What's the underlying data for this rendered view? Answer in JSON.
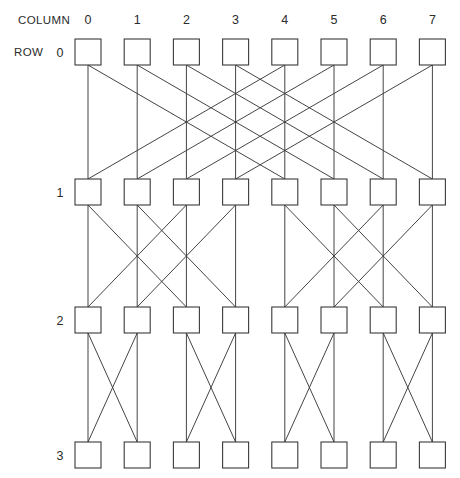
{
  "diagram": {
    "kind": "butterfly-network",
    "column_axis_label": "COLUMN",
    "row_axis_label": "ROW",
    "column_labels": [
      "0",
      "1",
      "2",
      "3",
      "4",
      "5",
      "6",
      "7"
    ],
    "row_labels": [
      "0",
      "1",
      "2",
      "3"
    ],
    "num_columns": 8,
    "num_rows": 4,
    "line_color": "#3a3a3a",
    "node_fill": "#ffffff",
    "node_stroke": "#3a3a3a",
    "background": "#ffffff",
    "geometry": {
      "first_col_center_x": 88,
      "col_spacing": 49.2,
      "box_width": 26,
      "box_height": 26,
      "row_center_y": [
        52,
        192,
        320,
        455
      ],
      "column_label_y": 20,
      "column_axis_label_x": 18,
      "row_axis_label_x": 14,
      "row_label_x": 60
    },
    "stages": [
      {
        "name": "stage-0",
        "from_row": 0,
        "to_row": 1,
        "stride": 4,
        "pairs": [
          [
            0,
            4
          ],
          [
            1,
            5
          ],
          [
            2,
            6
          ],
          [
            3,
            7
          ]
        ]
      },
      {
        "name": "stage-1",
        "from_row": 1,
        "to_row": 2,
        "stride": 2,
        "pairs": [
          [
            0,
            2
          ],
          [
            1,
            3
          ],
          [
            4,
            6
          ],
          [
            5,
            7
          ]
        ]
      },
      {
        "name": "stage-2",
        "from_row": 2,
        "to_row": 3,
        "stride": 1,
        "pairs": [
          [
            0,
            1
          ],
          [
            2,
            3
          ],
          [
            4,
            5
          ],
          [
            6,
            7
          ]
        ]
      }
    ]
  }
}
